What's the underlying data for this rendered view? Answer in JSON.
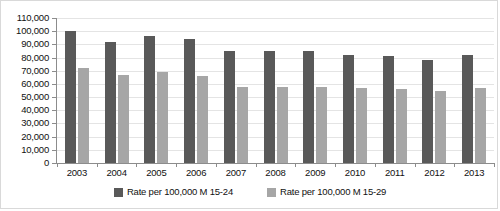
{
  "chart_data": {
    "type": "bar",
    "title": "",
    "subtitle": "",
    "xlabel": "",
    "ylabel": "",
    "categories": [
      "2003",
      "2004",
      "2005",
      "2006",
      "2007",
      "2008",
      "2009",
      "2010",
      "2011",
      "2012",
      "2013"
    ],
    "series": [
      {
        "name": "Rate per 100,000 M 15-24",
        "color": "#595959",
        "values": [
          100000,
          92000,
          96000,
          94000,
          85000,
          85000,
          85000,
          82000,
          81000,
          78000,
          82000
        ]
      },
      {
        "name": "Rate per 100,000 M 15-29",
        "color": "#a6a6a6",
        "values": [
          72000,
          67000,
          69000,
          66000,
          58000,
          58000,
          58000,
          57000,
          56000,
          55000,
          57000
        ]
      }
    ],
    "ylim": [
      0,
      110000
    ],
    "y_tick_step": 10000,
    "y_tick_labels": [
      "110,000",
      "100,000",
      "90,000",
      "80,000",
      "70,000",
      "60,000",
      "50,000",
      "40,000",
      "30,000",
      "20,000",
      "10,000",
      "0"
    ],
    "y_tick_values": [
      110000,
      100000,
      90000,
      80000,
      70000,
      60000,
      50000,
      40000,
      30000,
      20000,
      10000,
      0
    ],
    "grid": true,
    "grid_orientation": "horizontal",
    "legend_position": "bottom"
  },
  "legend": {
    "entries": [
      {
        "label": "Rate per 100,000 M 15-24",
        "color": "#595959"
      },
      {
        "label": "Rate per 100,000 M 15-29",
        "color": "#a6a6a6"
      }
    ]
  }
}
